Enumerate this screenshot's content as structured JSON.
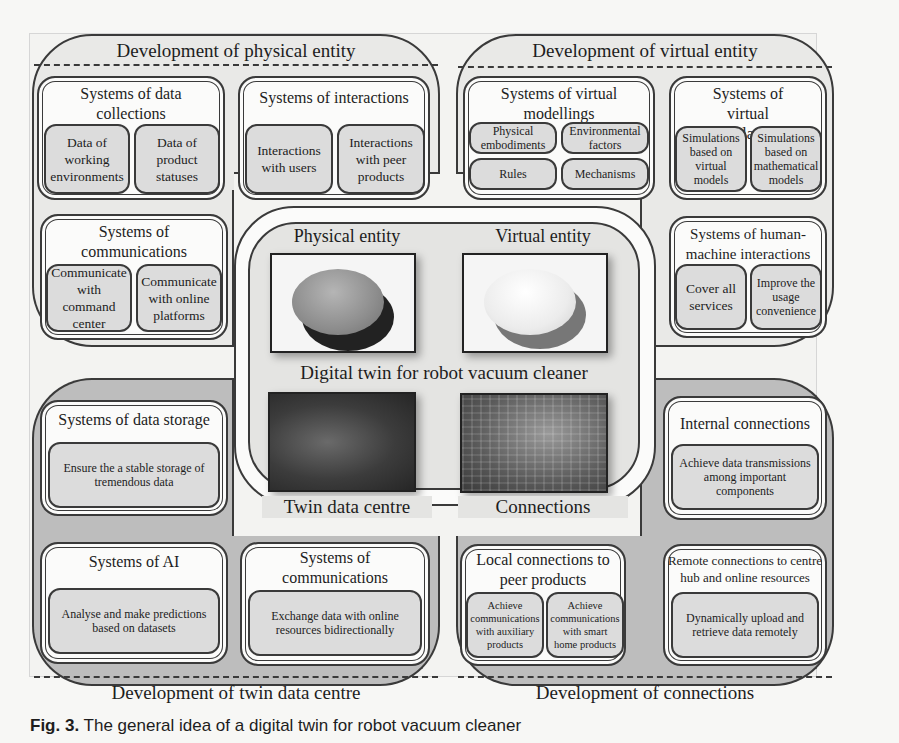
{
  "diagram": {
    "center": {
      "title": "Digital twin for robot vacuum cleaner",
      "physical_entity_label": "Physical entity",
      "virtual_entity_label": "Virtual entity",
      "twin_data_centre_label": "Twin data centre",
      "connections_label": "Connections"
    },
    "physical": {
      "title": "Development of physical entity",
      "data_collections": {
        "title": "Systems of data collections",
        "items": [
          "Data of working environments",
          "Data of product statuses"
        ]
      },
      "interactions": {
        "title": "Systems of interactions",
        "items": [
          "Interactions with users",
          "Interactions with peer products"
        ]
      },
      "communications": {
        "title": "Systems of communications",
        "items": [
          "Communicate with command center",
          "Communicate with online platforms"
        ]
      }
    },
    "virtual": {
      "title": "Development of virtual entity",
      "modellings": {
        "title": "Systems of virtual modellings",
        "items": [
          "Physical embodiments",
          "Environmental factors",
          "Rules",
          "Mechanisms"
        ]
      },
      "simulations": {
        "title": "Systems of virtual simulations",
        "items": [
          "Simulations based on virtual models",
          "Simulations based on mathematical models"
        ]
      },
      "hmi": {
        "title": "Systems of human-machine interactions",
        "items": [
          "Cover all services",
          "Improve the usage convenience"
        ]
      }
    },
    "twin_data_centre": {
      "title": "Development of twin data centre",
      "storage": {
        "title": "Systems of data storage",
        "items": [
          "Ensure the a stable storage of tremendous data"
        ]
      },
      "ai": {
        "title": "Systems of AI",
        "items": [
          "Analyse and make predictions based on datasets"
        ]
      },
      "communications": {
        "title": "Systems of communications",
        "items": [
          "Exchange data with online resources bidirectionally"
        ]
      }
    },
    "connections": {
      "title": "Development of connections",
      "internal": {
        "title": "Internal connections",
        "items": [
          "Achieve data transmissions among important components"
        ]
      },
      "local": {
        "title": "Local connections to peer products",
        "items": [
          "Achieve communications with auxiliary products",
          "Achieve communications with smart home products"
        ]
      },
      "remote": {
        "title": "Remote connections to centre hub and online resources",
        "items": [
          "Dynamically upload and retrieve data remotely"
        ]
      }
    }
  },
  "caption": {
    "label": "Fig. 3.",
    "text": "The general idea of a digital twin for robot vacuum cleaner"
  }
}
